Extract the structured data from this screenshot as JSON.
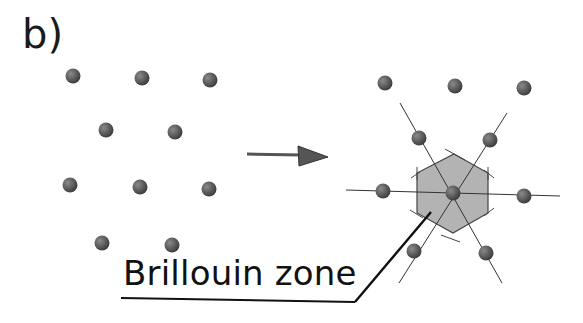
{
  "panel_label": "b)",
  "annotation": {
    "text": "Brillouin zone"
  },
  "colors": {
    "dot": "#555555",
    "dot_highlight": "#8a8a8a",
    "hexagon_fill": "#b3b3b3",
    "line": "#333333",
    "arrow": "#555555"
  },
  "left_lattice": {
    "points": [
      [
        73,
        76
      ],
      [
        142,
        78
      ],
      [
        210,
        80
      ],
      [
        106,
        130
      ],
      [
        175,
        132
      ],
      [
        70,
        185
      ],
      [
        140,
        187
      ],
      [
        209,
        189
      ],
      [
        102,
        243
      ],
      [
        172,
        245
      ]
    ]
  },
  "arrow": {
    "from": [
      247,
      154
    ],
    "to": [
      328,
      157
    ]
  },
  "right_lattice": {
    "center": [
      453,
      193
    ],
    "points": [
      [
        385,
        83
      ],
      [
        455,
        86
      ],
      [
        524,
        88
      ],
      [
        419,
        138
      ],
      [
        490,
        140
      ],
      [
        383,
        191
      ],
      [
        453,
        193
      ],
      [
        524,
        196
      ],
      [
        414,
        251
      ],
      [
        486,
        253
      ]
    ],
    "hexagon": [
      [
        454,
        154
      ],
      [
        488,
        173
      ],
      [
        488,
        213
      ],
      [
        453,
        233
      ],
      [
        417,
        213
      ],
      [
        417,
        173
      ]
    ]
  }
}
